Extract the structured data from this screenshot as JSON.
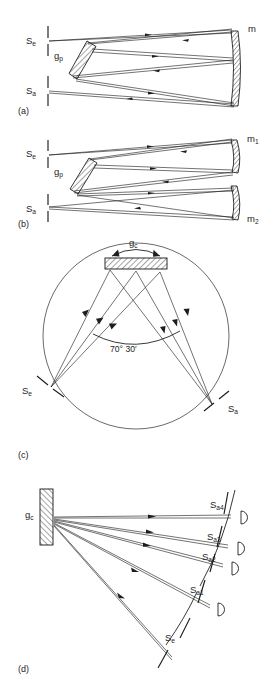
{
  "figure": {
    "title_fragment_cropped": "",
    "panels": [
      {
        "id": "a",
        "panel_label": "(a)",
        "description": "Double-pass plane grating monochromator with single concave mirror",
        "labels": {
          "entrance_slit": "S",
          "entrance_slit_sub": "e",
          "exit_slit": "S",
          "exit_slit_sub": "a",
          "grating": "g",
          "grating_sub": "p",
          "mirror": "m",
          "mirror_sub": ""
        }
      },
      {
        "id": "b",
        "panel_label": "(b)",
        "description": "Czerny-Turner style plane grating mount with two concave mirrors",
        "labels": {
          "entrance_slit": "S",
          "entrance_slit_sub": "e",
          "exit_slit": "S",
          "exit_slit_sub": "a",
          "grating": "g",
          "grating_sub": "p",
          "mirror_1": "m",
          "mirror_1_sub": "1",
          "mirror_2": "m",
          "mirror_2_sub": "2"
        }
      },
      {
        "id": "c",
        "panel_label": "(c)",
        "description": "Rowland circle concave grating mount, Paschen-Runge type",
        "labels": {
          "grating": "g",
          "grating_sub": "c",
          "entrance_slit": "S",
          "entrance_slit_sub": "e",
          "exit_slit": "S",
          "exit_slit_sub": "a",
          "angle": "70° 30′"
        }
      },
      {
        "id": "d",
        "panel_label": "(d)",
        "description": "Concave grating polychromator with multiple exit slits and detectors",
        "labels": {
          "grating": "g",
          "grating_sub": "c",
          "entrance_slit": "S",
          "entrance_slit_sub": "e",
          "exit_slits": [
            {
              "base": "S",
              "sub": "a4"
            },
            {
              "base": "S",
              "sub": "a3"
            },
            {
              "base": "S",
              "sub": "a2"
            },
            {
              "base": "S",
              "sub": "a1"
            }
          ]
        }
      }
    ],
    "colors": {
      "ink": "#1d1d1d",
      "background": "#ffffff",
      "rule": "#2a2a2a"
    }
  }
}
